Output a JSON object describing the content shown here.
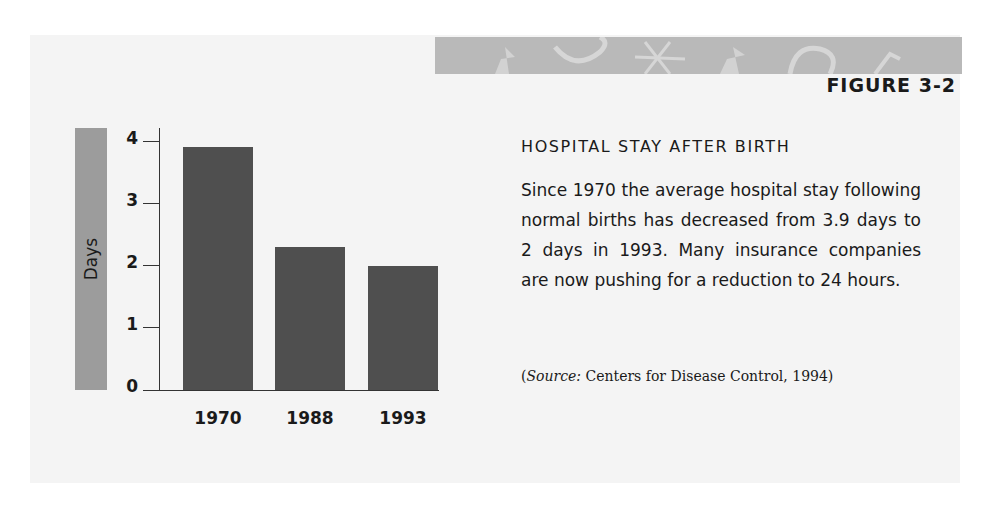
{
  "figure": {
    "label": "FIGURE 3-2",
    "title": "HOSPITAL STAY AFTER BIRTH",
    "body": "Since 1970 the average hospital stay following normal births has decreased from 3.9 days to 2 days in 1993. Many insurance companies are now pushing for a reduction to 24 hours.",
    "source_prefix": "Source:",
    "source_text": " Centers for Disease Control, 1994)",
    "source_open": "("
  },
  "colors": {
    "bar": "#4f4f4f",
    "axis_label_box": "#9c9c9c",
    "header_band": "#b9b9b9",
    "panel": "#f4f4f4"
  },
  "chart_data": {
    "type": "bar",
    "title": "HOSPITAL STAY AFTER BIRTH",
    "categories": [
      "1970",
      "1988",
      "1993"
    ],
    "values": [
      3.9,
      2.3,
      2.0
    ],
    "xlabel": "",
    "ylabel": "Days",
    "ylim": [
      0,
      4
    ],
    "yticks": [
      "0",
      "1",
      "2",
      "3",
      "4"
    ],
    "grid": false,
    "legend": null
  }
}
